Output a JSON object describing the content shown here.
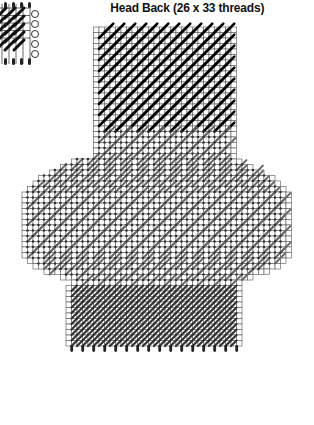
{
  "title": "Head Back (26 x 33 threads)",
  "pattern": {
    "cell_size": 5.5,
    "origin_x": 93.5,
    "origin_y": 27,
    "width_threads": 26,
    "height_threads": 33,
    "colors": {
      "grid": "#555555",
      "dark_stitch": "#000000",
      "gray_stitch": "#555555",
      "background": "#ffffff"
    },
    "sections": [
      {
        "name": "top-dark-block",
        "rows": [
          0,
          18
        ],
        "stitch": "dark"
      },
      {
        "name": "top-gray-band",
        "rows": [
          19,
          23
        ],
        "stitch": "gray"
      },
      {
        "name": "wide-body",
        "rows": [
          24,
          52
        ],
        "stitch": "gray"
      },
      {
        "name": "bottom-gray-block",
        "rows": [
          53,
          63
        ],
        "stitch": "gray"
      }
    ]
  },
  "legend_swatch": {
    "description": "partial stitch sample with open circles"
  }
}
